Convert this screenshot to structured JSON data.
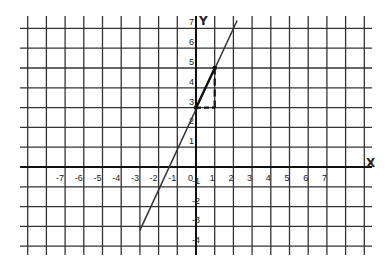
{
  "diagram": {
    "type": "coordinate-grid-line-graph",
    "axes": {
      "x_label": "X",
      "y_label": "Y",
      "x_ticks": [
        "-7",
        "-6",
        "-5",
        "-4",
        "-3",
        "-2",
        "-1",
        "0",
        "1",
        "2",
        "3",
        "4",
        "5",
        "6",
        "7"
      ],
      "y_ticks_positive": [
        "1",
        "2",
        "3",
        "4",
        "5",
        "6",
        "7"
      ],
      "y_ticks_negative": [
        "-1",
        "-2",
        "-3",
        "-4"
      ]
    },
    "line": {
      "description": "Straight line with slope 2 and y-intercept 3 (y = 2x + 3)",
      "from": [
        -3,
        -3.2
      ],
      "to": [
        2.2,
        7.4
      ],
      "color": "#333333"
    },
    "slope_triangle": {
      "points": [
        [
          0,
          3
        ],
        [
          1,
          3
        ],
        [
          1,
          5
        ]
      ],
      "rise": 2,
      "run": 1,
      "style": "dashed"
    },
    "highlight_points": [
      [
        0,
        3
      ],
      [
        1,
        5
      ]
    ]
  }
}
